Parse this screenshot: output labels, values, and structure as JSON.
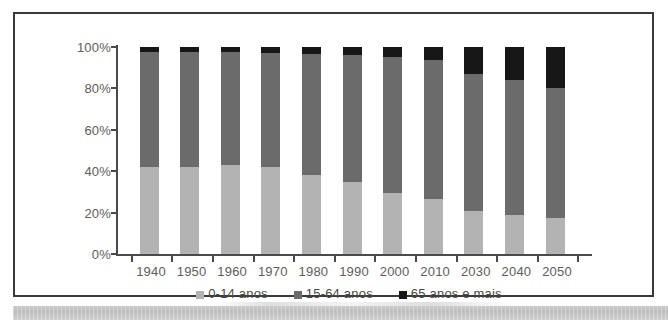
{
  "chart_data": {
    "type": "bar",
    "stacked": true,
    "normalized": true,
    "title": "",
    "subtitle": "",
    "xlabel": "",
    "ylabel": "",
    "categories": [
      "1940",
      "1950",
      "1960",
      "1970",
      "1980",
      "1990",
      "2000",
      "2010",
      "2030",
      "2040",
      "2050"
    ],
    "series": [
      {
        "name": "0-14 anos",
        "color": "#b3b3b3",
        "values": [
          42,
          42,
          43,
          42,
          38,
          35,
          29.5,
          26.5,
          21,
          19,
          17.5
        ]
      },
      {
        "name": "15-64 anos",
        "color": "#6b6b6b",
        "values": [
          55.5,
          55.5,
          54.5,
          55,
          58.5,
          61,
          65.5,
          67,
          66,
          65,
          62.5
        ]
      },
      {
        "name": "65 anos e mais",
        "color": "#171717",
        "values": [
          2.5,
          2.5,
          2.5,
          3,
          3.5,
          4,
          5,
          6.5,
          13,
          16,
          20
        ]
      }
    ],
    "ylim": [
      0,
      100
    ],
    "yticks": [
      "0%",
      "20%",
      "40%",
      "60%",
      "80%",
      "100%"
    ],
    "ytick_values": [
      0,
      20,
      40,
      60,
      80,
      100
    ],
    "grid": false,
    "legend_position": "bottom",
    "legend": [
      "0-14 anos",
      "15-64 anos",
      "65 anos e mais"
    ],
    "colors": {
      "young": "#b3b3b3",
      "adult": "#6b6b6b",
      "old": "#171717",
      "axis": "#4a4a4a",
      "text": "#5d5d5d",
      "frame": "#3a3a3a",
      "background": "#ffffff"
    }
  }
}
